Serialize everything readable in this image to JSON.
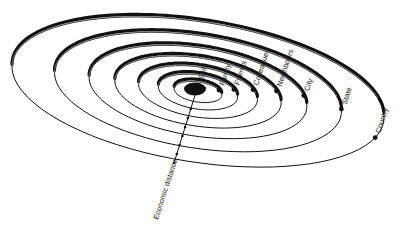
{
  "diagram": {
    "center_label": "Self",
    "axis_label": "Economic distance",
    "rings": [
      {
        "label": "Family"
      },
      {
        "label": "Friends"
      },
      {
        "label": "Colleagues"
      },
      {
        "label": "Neighbours"
      },
      {
        "label": "City"
      },
      {
        "label": "State"
      },
      {
        "label": "Country"
      }
    ],
    "colors": {
      "ink": "#111111",
      "background": "#ffffff"
    }
  }
}
